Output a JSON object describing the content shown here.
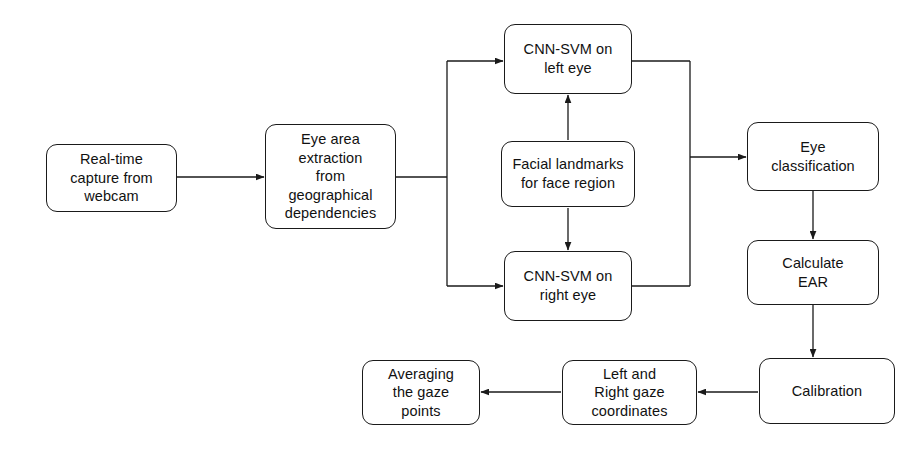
{
  "diagram": {
    "background_color": "#ffffff",
    "line_color": "#1a1a1a",
    "text_color": "#111111",
    "nodes": [
      {
        "id": "realtime-capture",
        "label": "Real-time\ncapture from\nwebcam",
        "x": 46,
        "y": 144,
        "w": 131,
        "h": 68
      },
      {
        "id": "eye-area-extraction",
        "label": "Eye area\nextraction\nfrom\ngeographical\ndependencies",
        "x": 265,
        "y": 124,
        "w": 131,
        "h": 105
      },
      {
        "id": "cnn-svm-left-eye",
        "label": "CNN-SVM on\nleft eye",
        "x": 504,
        "y": 24,
        "w": 128,
        "h": 70
      },
      {
        "id": "facial-landmarks",
        "label": "Facial landmarks\nfor face region",
        "x": 501,
        "y": 141,
        "w": 134,
        "h": 66
      },
      {
        "id": "cnn-svm-right-eye",
        "label": "CNN-SVM on\nright eye",
        "x": 504,
        "y": 251,
        "w": 128,
        "h": 70
      },
      {
        "id": "eye-classification",
        "label": "Eye\nclassification",
        "x": 747,
        "y": 122,
        "w": 132,
        "h": 69
      },
      {
        "id": "calculate-ear",
        "label": "Calculate\nEAR",
        "x": 747,
        "y": 240,
        "w": 132,
        "h": 65
      },
      {
        "id": "calibration",
        "label": "Calibration",
        "x": 759,
        "y": 358,
        "w": 136,
        "h": 66
      },
      {
        "id": "left-right-gaze-coordinates",
        "label": "Left and\nRight gaze\ncoordinates",
        "x": 562,
        "y": 360,
        "w": 135,
        "h": 65
      },
      {
        "id": "averaging-gaze-points",
        "label": "Averaging\nthe gaze\npoints",
        "x": 362,
        "y": 360,
        "w": 118,
        "h": 65
      }
    ],
    "connectors": [
      {
        "id": "capture-to-extraction",
        "from": "realtime-capture",
        "to": "eye-area-extraction",
        "arrow": true
      },
      {
        "id": "extraction-to-branch",
        "from": "eye-area-extraction",
        "to": "branch-point",
        "arrow": false
      },
      {
        "id": "branch-to-left-eye",
        "from": "branch-point",
        "to": "cnn-svm-left-eye",
        "arrow": true
      },
      {
        "id": "branch-to-right-eye",
        "from": "branch-point",
        "to": "cnn-svm-right-eye",
        "arrow": true
      },
      {
        "id": "landmarks-to-left-eye",
        "from": "facial-landmarks",
        "to": "cnn-svm-left-eye",
        "arrow": true
      },
      {
        "id": "landmarks-to-right-eye",
        "from": "facial-landmarks",
        "to": "cnn-svm-right-eye",
        "arrow": true
      },
      {
        "id": "left-eye-to-merge",
        "from": "cnn-svm-left-eye",
        "to": "merge-point",
        "arrow": false
      },
      {
        "id": "right-eye-to-merge",
        "from": "cnn-svm-right-eye",
        "to": "merge-point",
        "arrow": false
      },
      {
        "id": "merge-to-eye-classification",
        "from": "merge-point",
        "to": "eye-classification",
        "arrow": true
      },
      {
        "id": "eye-classification-to-calculate-ear",
        "from": "eye-classification",
        "to": "calculate-ear",
        "arrow": true
      },
      {
        "id": "calculate-ear-to-calibration",
        "from": "calculate-ear",
        "to": "calibration",
        "arrow": true
      },
      {
        "id": "calibration-to-gaze-coordinates",
        "from": "calibration",
        "to": "left-right-gaze-coordinates",
        "arrow": true
      },
      {
        "id": "gaze-coordinates-to-averaging",
        "from": "left-right-gaze-coordinates",
        "to": "averaging-gaze-points",
        "arrow": true
      }
    ]
  }
}
